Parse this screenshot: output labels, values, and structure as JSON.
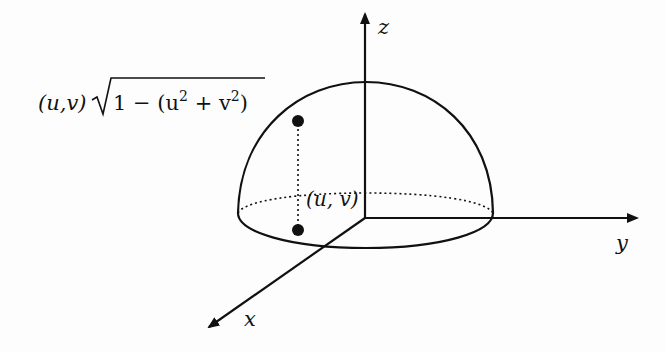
{
  "diagram": {
    "type": "hemisphere-3d-axes",
    "axes": {
      "x_label": "x",
      "y_label": "y",
      "z_label": "z"
    },
    "labels": {
      "point_top": "(u,v)√1 − (u² + v²)",
      "point_top_prefix": "(u,v)",
      "point_top_radicand": "1 − (u",
      "point_top_sup1": "2",
      "point_top_mid": " + v",
      "point_top_sup2": "2",
      "point_top_close": ")",
      "point_base": "(u, v)"
    },
    "colors": {
      "stroke": "#111111",
      "background": "#fdfdfd"
    }
  }
}
